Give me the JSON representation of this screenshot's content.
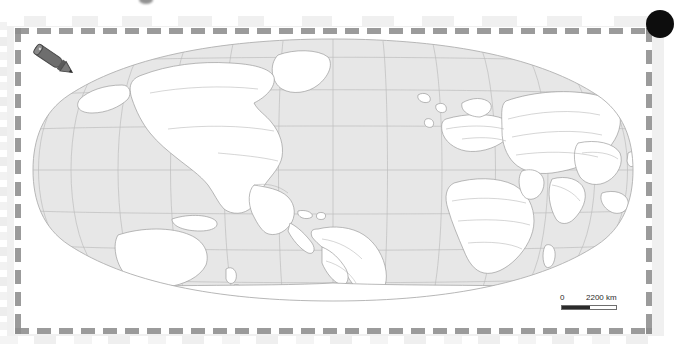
{
  "document": {
    "type": "world-map-worksheet",
    "projection": "Robinson",
    "background_color": "#ffffff",
    "paper_color": "#f0f0f0",
    "card_color": "#ffffff"
  },
  "frame": {
    "style": "dashed",
    "color": "#9b9b9b",
    "dash_length_px": 14,
    "gap_length_px": 8
  },
  "map": {
    "name": "world-map",
    "graticule": {
      "visible": true,
      "color": "#b9b9b9",
      "meridian_spacing_deg": 20,
      "parallel_spacing_deg": 20
    },
    "ocean_color": "#e6e6e6",
    "land_color": "#ffffff",
    "border_color": "#9a9a9a",
    "outline_color": "#a8a8a8",
    "labels_visible": false,
    "regions": [
      "North America",
      "South America",
      "Europe",
      "Africa",
      "Asia",
      "Australia",
      "Antarctica"
    ]
  },
  "scale_bar": {
    "name": "map-scale-bar",
    "min_label": "0",
    "max_label": "2200 km",
    "units": "km",
    "max_value": 2200,
    "fill_color": "#2b2b2b",
    "outline_color": "#6e6e6e"
  },
  "annotations": {
    "pencil_icon": {
      "name": "pencil-icon",
      "body_color": "#6b6b6b",
      "tip_color": "#555555"
    },
    "corner_dot": {
      "name": "corner-dot",
      "color": "#0d0d0d"
    }
  }
}
